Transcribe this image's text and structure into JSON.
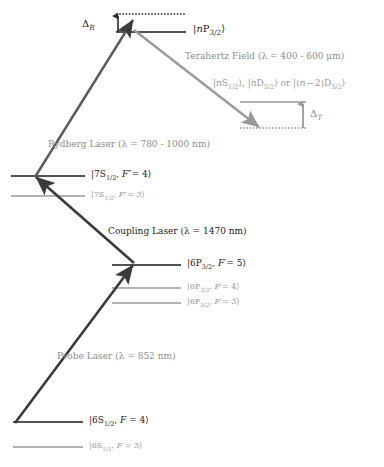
{
  "figure": {
    "type": "energy-level-diagram",
    "title": "",
    "background_color": "#ffffff",
    "colors": {
      "dark_line": "#1a1a1a",
      "gray_line": "#999999",
      "arrow_dark": "#3a3a3a",
      "arrow_gray": "#9a9a9a",
      "text_dark": "#1a1a1a",
      "text_gray": "#999999"
    }
  },
  "levels": {
    "rydberg_np": {
      "label": "|nP_{3/2}>",
      "label_html": "|<i>n</i>P<sub>3/2</sub>&#10217;",
      "style": "solid-dark",
      "x1": 116,
      "x2": 186,
      "y": 32,
      "label_x": 193,
      "label_y": 25
    },
    "rydberg_np_dashed": {
      "label": "",
      "style": "dotted-dark",
      "x1": 116,
      "x2": 186,
      "y": 14
    },
    "thz_target": {
      "label": "|nS_{1/2}>, |nD_{5/2}> or |(n-2)D_{5/2}>",
      "label_html": "|<i>n</i>S<sub>1/2</sub>&#10217;, |<i>n</i>D<sub>5/2</sub>&#10217; or |(<i>n</i> &#8722; 2)D<sub>5/2</sub>&#10217;",
      "style": "solid-gray",
      "x1": 240,
      "x2": 306,
      "y": 102,
      "label_x": 213,
      "label_y": 80
    },
    "thz_target_dashed": {
      "label": "",
      "style": "dotted-gray",
      "x1": 240,
      "x2": 306,
      "y": 128
    },
    "s7_f4": {
      "label": "|7S_{1/2}, F''= 4>",
      "label_html": "|7S<sub>1/2</sub>, <i>F</i>&#8243;= 4&#10217;",
      "style": "solid-dark",
      "x1": 11,
      "x2": 85,
      "y": 176,
      "label_x": 91,
      "label_y": 170
    },
    "s7_f3": {
      "label": "|7S_{1/2}, F''= 3>",
      "label_html": "|7S<sub>1/2</sub>, <i>F</i>&#8243;= 3&#10217;",
      "style": "solid-gray",
      "x1": 11,
      "x2": 85,
      "y": 196,
      "label_x": 91,
      "label_y": 191
    },
    "p6_f5": {
      "label": "|6P_{3/2}, F'= 5>",
      "label_html": "|6P<sub>3/2</sub>, <i>F</i>&#8242;= 5&#10217;",
      "style": "solid-dark",
      "x1": 112,
      "x2": 181,
      "y": 265,
      "label_x": 187,
      "label_y": 259
    },
    "p6_f4": {
      "label": "|6P_{3/2}, F'= 4>",
      "label_html": "|6P<sub>3/2</sub>, <i>F</i>&#8242;= 4&#10217;",
      "style": "solid-gray",
      "x1": 112,
      "x2": 181,
      "y": 288,
      "label_x": 187,
      "label_y": 283
    },
    "p6_f3": {
      "label": "|6P_{3/2}, F'= 3>",
      "label_html": "|6P<sub>3/2</sub>, <i>F</i>&#8242;= 3&#10217;",
      "style": "solid-gray",
      "x1": 112,
      "x2": 181,
      "y": 303,
      "label_x": 187,
      "label_y": 298
    },
    "s6_f4": {
      "label": "|6S_{1/2}, F = 4>",
      "label_html": "|6S<sub>1/2</sub>, <i>F</i> = 4&#10217;",
      "style": "solid-dark",
      "x1": 13,
      "x2": 83,
      "y": 422,
      "label_x": 89,
      "label_y": 416
    },
    "s6_f3": {
      "label": "|6S_{1/2}, F = 3>",
      "label_html": "|6S<sub>1/2</sub>, <i>F</i> = 3&#10217;",
      "style": "solid-gray",
      "x1": 13,
      "x2": 83,
      "y": 447,
      "label_x": 89,
      "label_y": 442
    }
  },
  "transitions": {
    "probe": {
      "label": "Probe Laser (λ = 852 nm)",
      "label_html": "Probe Laser (&#955; = 852 nm)",
      "wavelength": "852 nm",
      "color": "dark",
      "label_x": 57,
      "label_y": 352,
      "x1": 15,
      "y1": 423,
      "x2": 134,
      "y2": 264
    },
    "coupling": {
      "label": "Coupling Laser (λ = 1470 nm)",
      "label_html": "Coupling Laser (&#955; = 1470 nm)",
      "wavelength": "1470 nm",
      "color": "dark",
      "label_x": 108,
      "label_y": 227,
      "x1": 134,
      "y1": 263,
      "x2": 35,
      "y2": 176
    },
    "rydberg": {
      "label": "Rydberg Laser (λ = 780 - 1000 nm)",
      "label_html": "Rydberg Laser (&#955; = 780 - 1000 nm)",
      "wavelength": "780 - 1000 nm",
      "color": "dark",
      "label_x": 48,
      "label_y": 140,
      "x1": 35,
      "y1": 176,
      "x2": 132,
      "y2": 20
    },
    "terahertz": {
      "label": "Terahertz Field (λ = 400 - 600 μm)",
      "label_html": "Terahertz Field (&#955; = 400 - 600 &#956;m)",
      "wavelength": "400 - 600 μm",
      "color": "gray",
      "label_x": 185,
      "label_y": 52,
      "x1": 133,
      "y1": 29,
      "x2": 258,
      "y2": 126
    }
  },
  "detunings": {
    "delta_r": {
      "label": "Δ_R",
      "label_html": "&#916;<sub><i>R</i></sub>",
      "label_x": 82,
      "label_y": 20,
      "arrow_x": 118,
      "y_top": 14,
      "y_bottom": 32,
      "color": "dark"
    },
    "delta_t": {
      "label": "Δ_T",
      "label_html": "&#916;<sub><i>T</i></sub>",
      "label_x": 311,
      "label_y": 110,
      "arrow_x": 303,
      "y_top": 102,
      "y_bottom": 128,
      "color": "gray"
    }
  }
}
